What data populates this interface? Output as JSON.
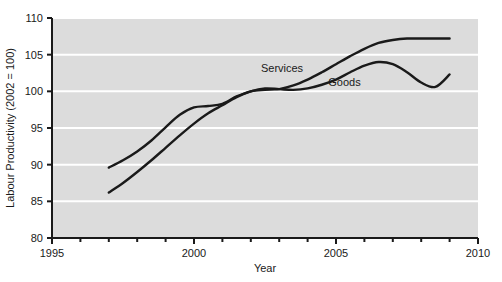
{
  "chart_data": {
    "type": "line",
    "title": "",
    "xlabel": "Year",
    "ylabel": "Labour Productivity (2002 = 100)",
    "xlim": [
      1995,
      2010
    ],
    "ylim": [
      80,
      110
    ],
    "xticks": [
      1995,
      2000,
      2005,
      2010
    ],
    "xtick_labels": [
      "1995",
      "2000",
      "2005",
      "2010"
    ],
    "xminor_tick_step": 1,
    "yticks": [
      80,
      85,
      90,
      95,
      100,
      105,
      110
    ],
    "ytick_labels": [
      "80",
      "85",
      "90",
      "95",
      "100",
      "105",
      "110"
    ],
    "grid": true,
    "grid_axis": "y",
    "grid_color": "#ffffff",
    "plot_background": "#dcdcdc",
    "figure_background": "#ffffff",
    "line_color": "#1a1a1a",
    "legend_position": "inline-annotations",
    "series": [
      {
        "name": "Services",
        "annotation_label": "Services",
        "annotation_x": 2003.1,
        "annotation_y": 102.6,
        "x": [
          1997.0,
          1997.5,
          1998.0,
          1998.5,
          1999.0,
          1999.5,
          2000.0,
          2000.5,
          2001.0,
          2001.5,
          2002.0,
          2002.5,
          2003.0,
          2003.5,
          2004.0,
          2004.5,
          2005.0,
          2005.5,
          2006.0,
          2006.5,
          2007.0,
          2007.5,
          2008.0,
          2008.5,
          2009.0
        ],
        "y": [
          89.6,
          90.6,
          91.8,
          93.3,
          95.1,
          96.8,
          97.8,
          98.0,
          98.3,
          99.3,
          100.0,
          100.2,
          100.3,
          100.8,
          101.6,
          102.6,
          103.7,
          104.8,
          105.8,
          106.6,
          107.0,
          107.2,
          107.2,
          107.2,
          107.2
        ]
      },
      {
        "name": "Goods",
        "annotation_label": "Goods",
        "annotation_x": 2005.3,
        "annotation_y": 100.7,
        "x": [
          1997.0,
          1997.5,
          1998.0,
          1998.5,
          1999.0,
          1999.5,
          2000.0,
          2000.5,
          2001.0,
          2001.5,
          2002.0,
          2002.5,
          2003.0,
          2003.5,
          2004.0,
          2004.5,
          2005.0,
          2005.5,
          2006.0,
          2006.5,
          2007.0,
          2007.5,
          2008.0,
          2008.5,
          2009.0
        ],
        "y": [
          86.2,
          87.5,
          89.0,
          90.6,
          92.3,
          94.0,
          95.6,
          97.0,
          98.1,
          99.2,
          100.0,
          100.4,
          100.3,
          100.2,
          100.4,
          100.9,
          101.6,
          102.6,
          103.5,
          104.0,
          103.7,
          102.6,
          101.2,
          100.6,
          102.3
        ]
      }
    ]
  },
  "axes": {
    "x_title": "Year",
    "y_title": "Labour Productivity (2002 = 100)"
  }
}
